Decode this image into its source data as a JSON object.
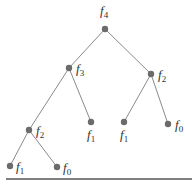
{
  "diagram": {
    "type": "tree",
    "edge_color": "#8a8a8a",
    "node_color": "#6b6b6b",
    "baseline_color": "#555555",
    "nodes": [
      {
        "id": "n0",
        "base": "f",
        "sub": "4",
        "x": 105,
        "y": 29,
        "lx": 100,
        "ly": 15
      },
      {
        "id": "n1",
        "base": "f",
        "sub": "3",
        "x": 69,
        "y": 68,
        "lx": 76,
        "ly": 73
      },
      {
        "id": "n2",
        "base": "f",
        "sub": "2",
        "x": 151,
        "y": 74,
        "lx": 158,
        "ly": 79
      },
      {
        "id": "n3",
        "base": "f",
        "sub": "2",
        "x": 29,
        "y": 130,
        "lx": 36,
        "ly": 135
      },
      {
        "id": "n4",
        "base": "f",
        "sub": "1",
        "x": 91,
        "y": 122,
        "lx": 87,
        "ly": 139
      },
      {
        "id": "n5",
        "base": "f",
        "sub": "1",
        "x": 124,
        "y": 122,
        "lx": 120,
        "ly": 139
      },
      {
        "id": "n6",
        "base": "f",
        "sub": "0",
        "x": 168,
        "y": 124,
        "lx": 175,
        "ly": 129
      },
      {
        "id": "n7",
        "base": "f",
        "sub": "1",
        "x": 10,
        "y": 166,
        "lx": 16,
        "ly": 171
      },
      {
        "id": "n8",
        "base": "f",
        "sub": "0",
        "x": 57,
        "y": 167,
        "lx": 63,
        "ly": 172
      }
    ],
    "edges": [
      [
        "n0",
        "n1"
      ],
      [
        "n0",
        "n2"
      ],
      [
        "n1",
        "n3"
      ],
      [
        "n1",
        "n4"
      ],
      [
        "n2",
        "n5"
      ],
      [
        "n2",
        "n6"
      ],
      [
        "n3",
        "n7"
      ],
      [
        "n3",
        "n8"
      ]
    ],
    "baseline": {
      "x1": 6,
      "x2": 192,
      "y": 179
    }
  }
}
